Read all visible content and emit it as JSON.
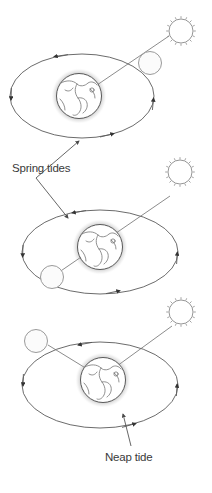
{
  "figure": {
    "type": "astronomy-diagram",
    "title": "",
    "background_color": "#ffffff",
    "line_color": "#5a5a5a",
    "text_color": "#3a3a3a"
  },
  "labels": {
    "spring_tides": "Spring tides",
    "neap_tide": "Neap tide"
  },
  "panels": [
    {
      "id": "panel-1",
      "configuration": "new-moon",
      "tide_type": "Spring tides",
      "moon_position": "right (between Earth and Sun)",
      "sun_position": "upper right",
      "orbit_direction": "counter-clockwise",
      "bodies": [
        "earth",
        "moon",
        "sun"
      ]
    },
    {
      "id": "panel-2",
      "configuration": "full-moon",
      "tide_type": "Spring tides",
      "moon_position": "lower left (opposite the Sun)",
      "sun_position": "upper right",
      "orbit_direction": "counter-clockwise",
      "bodies": [
        "earth",
        "moon",
        "sun"
      ]
    },
    {
      "id": "panel-3",
      "configuration": "quarter-moon",
      "tide_type": "Neap tide",
      "moon_position": "upper left (at right angle to the Sun)",
      "sun_position": "upper right",
      "orbit_direction": "counter-clockwise",
      "bodies": [
        "earth",
        "moon",
        "sun"
      ]
    }
  ],
  "icons": {
    "sun": "sun-icon",
    "moon": "moon-icon",
    "earth": "earth-globe-icon",
    "orbit_arrow": "orbit-direction-arrow-icon",
    "leader_arrow": "label-leader-arrow-icon"
  }
}
